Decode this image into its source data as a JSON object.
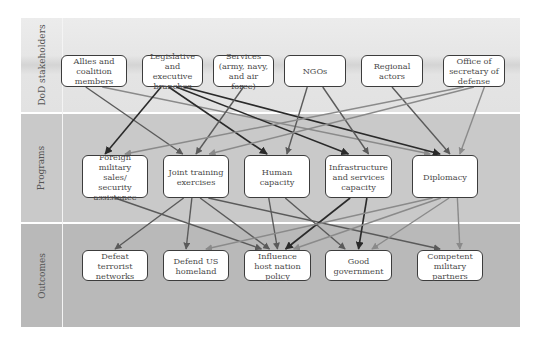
{
  "bands": [
    {
      "id": "stake",
      "label": "DoD stakeholders"
    },
    {
      "id": "prog",
      "label": "Programs"
    },
    {
      "id": "out",
      "label": "Outcomes"
    }
  ],
  "nodes": {
    "stakeholders": [
      {
        "id": "allies",
        "label": "Allies and coalition members"
      },
      {
        "id": "legis",
        "label": "Legislative and executive branches"
      },
      {
        "id": "services",
        "label": "Services (army, navy, and air force)"
      },
      {
        "id": "ngos",
        "label": "NGOs"
      },
      {
        "id": "regional",
        "label": "Regional actors"
      },
      {
        "id": "osd",
        "label": "Office of secretary of defense"
      }
    ],
    "programs": [
      {
        "id": "fms",
        "label": "Foreign military sales/ security assistance"
      },
      {
        "id": "joint",
        "label": "Joint training exercises"
      },
      {
        "id": "human",
        "label": "Human capacity"
      },
      {
        "id": "infra",
        "label": "Infrastructure and services capacity"
      },
      {
        "id": "diplo",
        "label": "Diplomacy"
      }
    ],
    "outcomes": [
      {
        "id": "defeat",
        "label": "Defeat terrorist networks"
      },
      {
        "id": "defend",
        "label": "Defend US homeland"
      },
      {
        "id": "influence",
        "label": "Influence host nation policy"
      },
      {
        "id": "goodgov",
        "label": "Good government"
      },
      {
        "id": "competent",
        "label": "Competent military partners"
      }
    ]
  },
  "edges": [
    {
      "from": "allies",
      "to": "joint",
      "weight": "medium"
    },
    {
      "from": "allies",
      "to": "diplo",
      "weight": "light"
    },
    {
      "from": "legis",
      "to": "fms",
      "weight": "dark"
    },
    {
      "from": "legis",
      "to": "human",
      "weight": "dark"
    },
    {
      "from": "legis",
      "to": "infra",
      "weight": "dark"
    },
    {
      "from": "legis",
      "to": "diplo",
      "weight": "dark"
    },
    {
      "from": "services",
      "to": "joint",
      "weight": "medium"
    },
    {
      "from": "ngos",
      "to": "human",
      "weight": "medium"
    },
    {
      "from": "ngos",
      "to": "infra",
      "weight": "medium"
    },
    {
      "from": "regional",
      "to": "diplo",
      "weight": "medium"
    },
    {
      "from": "osd",
      "to": "fms",
      "weight": "light"
    },
    {
      "from": "osd",
      "to": "joint",
      "weight": "light"
    },
    {
      "from": "osd",
      "to": "diplo",
      "weight": "light"
    },
    {
      "from": "fms",
      "to": "influence",
      "weight": "medium"
    },
    {
      "from": "joint",
      "to": "defeat",
      "weight": "medium"
    },
    {
      "from": "joint",
      "to": "defend",
      "weight": "medium"
    },
    {
      "from": "joint",
      "to": "influence",
      "weight": "medium"
    },
    {
      "from": "joint",
      "to": "competent",
      "weight": "medium"
    },
    {
      "from": "human",
      "to": "influence",
      "weight": "medium"
    },
    {
      "from": "human",
      "to": "goodgov",
      "weight": "medium"
    },
    {
      "from": "infra",
      "to": "influence",
      "weight": "dark"
    },
    {
      "from": "infra",
      "to": "goodgov",
      "weight": "dark"
    },
    {
      "from": "diplo",
      "to": "defend",
      "weight": "light"
    },
    {
      "from": "diplo",
      "to": "influence",
      "weight": "light"
    },
    {
      "from": "diplo",
      "to": "goodgov",
      "weight": "light"
    },
    {
      "from": "diplo",
      "to": "competent",
      "weight": "light"
    }
  ],
  "colors": {
    "dark": "#2a2a2a",
    "medium": "#5a5a5a",
    "light": "#8a8a8a",
    "node_border": "#3c3c3c",
    "node_fill": "#ffffff"
  }
}
